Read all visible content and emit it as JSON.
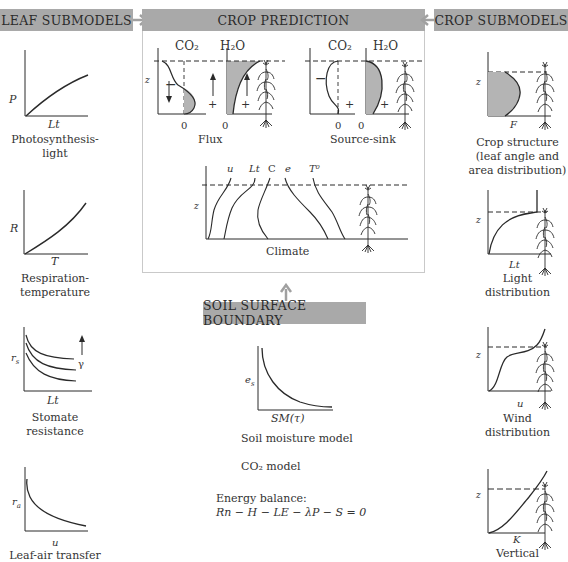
{
  "headers": {
    "leaf": "LEAF SUBMODELS",
    "crop_prediction": "CROP PREDICTION",
    "crop": "CROP SUBMODELS",
    "soil": "SOIL SURFACE BOUNDARY"
  },
  "colors": {
    "header_bg": "#a9a9a9",
    "arrow": "#a0a0a0",
    "box_border": "#c9c9c9",
    "fill": "#b4b4b4",
    "line": "#2a2a2a"
  },
  "leaf_submodels": [
    {
      "ylabel": "P",
      "xlabel": "Lt",
      "caption": [
        "Photosynthesis-",
        "light"
      ]
    },
    {
      "ylabel": "R",
      "xlabel": "T",
      "caption": [
        "Respiration-",
        "temperature"
      ]
    },
    {
      "ylabel": "rs",
      "xlabel": "Lt",
      "param": "γ",
      "caption": [
        "Stomate",
        "resistance"
      ]
    },
    {
      "ylabel": "ra",
      "xlabel": "u",
      "caption": [
        "Leaf-air transfer"
      ]
    }
  ],
  "crop_prediction": {
    "flux": {
      "caption": "Flux",
      "labels": [
        "CO₂",
        "H₂O"
      ],
      "zlabel": "z",
      "zeros": [
        "0",
        "0"
      ],
      "signs": [
        "−",
        "+",
        "+"
      ]
    },
    "source_sink": {
      "caption": "Source-sink",
      "labels": [
        "CO₂",
        "H₂O"
      ],
      "zeros": [
        "0",
        "0"
      ],
      "signs": [
        "−",
        "+",
        "+"
      ]
    },
    "climate": {
      "caption": "Climate",
      "zlabel": "z",
      "curves": [
        "u",
        "Lt",
        "C",
        "e",
        "T⁰"
      ]
    }
  },
  "crop_submodels": [
    {
      "ylabel": "z",
      "xlabel": "F",
      "caption": [
        "Crop structure",
        "(leaf angle and",
        "area distribution)"
      ]
    },
    {
      "ylabel": "z",
      "xlabel": "Lt",
      "caption": [
        "Light",
        "distribution"
      ]
    },
    {
      "ylabel": "z",
      "xlabel": "u",
      "caption": [
        "Wind",
        "distribution"
      ]
    },
    {
      "ylabel": "z",
      "xlabel": "K",
      "caption": [
        "Vertical"
      ]
    }
  ],
  "soil": {
    "ylabel": "es",
    "xlabel": "SM(τ)",
    "caption": "Soil moisture model",
    "co2_model": "CO₂ model",
    "energy_label": "Energy balance:",
    "energy_eq": "Rn − H − LE − λP − S = 0"
  }
}
